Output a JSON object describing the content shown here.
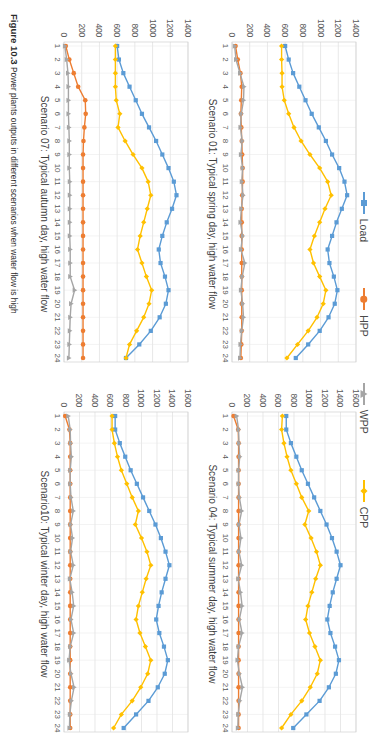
{
  "figure": {
    "caption_label": "Figure 10.3",
    "caption_text": "Power plants outputs in different scenarios when water flow is high"
  },
  "legend": {
    "items": [
      {
        "label": "Load",
        "marker": "square-marker-icon",
        "color": "#5B9BD5"
      },
      {
        "label": "HPP",
        "marker": "circle-marker-icon",
        "color": "#ED7D31"
      },
      {
        "label": "WPP",
        "marker": "triangle-marker-icon",
        "color": "#A5A5A5"
      },
      {
        "label": "CPP",
        "marker": "diamond-marker-icon",
        "color": "#FFC000"
      }
    ]
  },
  "chart_data": [
    {
      "id": "scenario-01",
      "type": "line",
      "title": "Scenario 01: Typical spring day, high water flow",
      "xlabel": "",
      "ylabel": "",
      "x": [
        1,
        2,
        3,
        4,
        5,
        6,
        7,
        8,
        9,
        10,
        11,
        12,
        13,
        14,
        15,
        16,
        17,
        18,
        19,
        20,
        21,
        22,
        23,
        24
      ],
      "xticklabels": [
        "1",
        "2",
        "3",
        "4",
        "5",
        "6",
        "7",
        "8",
        "9",
        "10",
        "11",
        "12",
        "13",
        "14",
        "15",
        "16",
        "17",
        "18",
        "19",
        "20",
        "21",
        "22",
        "23",
        "24"
      ],
      "yticklabels": [
        "0",
        "200",
        "400",
        "600",
        "800",
        "1000",
        "1200",
        "1400"
      ],
      "ylim": [
        0,
        1400
      ],
      "yticks": [
        0,
        200,
        400,
        600,
        800,
        1000,
        1200,
        1400
      ],
      "grid": true,
      "legend_position": "top",
      "series": [
        {
          "name": "Load",
          "color": "#5B9BD5",
          "marker": "square",
          "values": [
            600,
            640,
            690,
            760,
            830,
            900,
            980,
            1060,
            1130,
            1210,
            1270,
            1300,
            1240,
            1180,
            1130,
            1080,
            1100,
            1150,
            1190,
            1160,
            1090,
            990,
            860,
            720
          ]
        },
        {
          "name": "CPP",
          "color": "#FFC000",
          "marker": "diamond",
          "values": [
            560,
            560,
            565,
            565,
            590,
            640,
            700,
            780,
            880,
            990,
            1080,
            1120,
            1050,
            990,
            930,
            880,
            920,
            990,
            1060,
            1030,
            960,
            860,
            740,
            620
          ]
        },
        {
          "name": "HPP",
          "color": "#ED7D31",
          "marker": "circle",
          "values": [
            40,
            65,
            95,
            110,
            105,
            100,
            105,
            110,
            115,
            120,
            120,
            115,
            110,
            110,
            110,
            110,
            110,
            110,
            110,
            110,
            110,
            110,
            105,
            100
          ]
        },
        {
          "name": "WPP",
          "color": "#A5A5A5",
          "marker": "triangle",
          "values": [
            30,
            45,
            90,
            135,
            130,
            105,
            95,
            115,
            100,
            120,
            110,
            125,
            105,
            95,
            120,
            100,
            145,
            115,
            100,
            120,
            130,
            110,
            95,
            90
          ]
        }
      ]
    },
    {
      "id": "scenario-04",
      "type": "line",
      "title": "Scenario 04: Typical summer day, high water flow",
      "xlabel": "",
      "ylabel": "",
      "x": [
        1,
        2,
        3,
        4,
        5,
        6,
        7,
        8,
        9,
        10,
        11,
        12,
        13,
        14,
        15,
        16,
        17,
        18,
        19,
        20,
        21,
        22,
        23,
        24
      ],
      "xticklabels": [
        "1",
        "2",
        "3",
        "4",
        "5",
        "6",
        "7",
        "8",
        "9",
        "10",
        "11",
        "12",
        "13",
        "14",
        "15",
        "16",
        "17",
        "18",
        "19",
        "20",
        "21",
        "22",
        "23",
        "24"
      ],
      "yticklabels": [
        "0",
        "200",
        "400",
        "600",
        "800",
        "1000",
        "1200",
        "1400",
        "1600"
      ],
      "ylim": [
        0,
        1600
      ],
      "yticks": [
        0,
        200,
        400,
        600,
        800,
        1000,
        1200,
        1400,
        1600
      ],
      "grid": true,
      "legend_position": "top",
      "series": [
        {
          "name": "Load",
          "color": "#5B9BD5",
          "marker": "square",
          "values": [
            700,
            700,
            760,
            830,
            900,
            980,
            1060,
            1140,
            1220,
            1290,
            1350,
            1400,
            1350,
            1300,
            1260,
            1230,
            1270,
            1330,
            1380,
            1340,
            1250,
            1130,
            960,
            790
          ]
        },
        {
          "name": "CPP",
          "color": "#FFC000",
          "marker": "diamond",
          "values": [
            650,
            640,
            670,
            710,
            760,
            830,
            900,
            990,
            940,
            1020,
            1090,
            1140,
            1080,
            1030,
            980,
            950,
            1000,
            1070,
            1140,
            1100,
            1010,
            900,
            760,
            640
          ]
        },
        {
          "name": "HPP",
          "color": "#ED7D31",
          "marker": "circle",
          "values": [
            20,
            80,
            85,
            85,
            85,
            85,
            85,
            85,
            85,
            85,
            85,
            85,
            85,
            85,
            85,
            85,
            85,
            85,
            85,
            85,
            85,
            85,
            85,
            85
          ]
        },
        {
          "name": "WPP",
          "color": "#A5A5A5",
          "marker": "triangle",
          "values": [
            60,
            85,
            90,
            100,
            85,
            85,
            95,
            125,
            90,
            115,
            90,
            125,
            80,
            110,
            130,
            95,
            130,
            85,
            70,
            95,
            135,
            100,
            80,
            75
          ]
        }
      ]
    },
    {
      "id": "scenario-07",
      "type": "line",
      "title": "Scenario 07: Typical autumn day, high water flow",
      "xlabel": "",
      "ylabel": "",
      "x": [
        1,
        2,
        3,
        4,
        5,
        6,
        7,
        8,
        9,
        10,
        11,
        12,
        13,
        14,
        15,
        16,
        17,
        18,
        19,
        20,
        21,
        22,
        23,
        24
      ],
      "xticklabels": [
        "1",
        "2",
        "3",
        "4",
        "5",
        "6",
        "7",
        "8",
        "9",
        "10",
        "11",
        "12",
        "13",
        "14",
        "15",
        "16",
        "17",
        "18",
        "19",
        "20",
        "21",
        "22",
        "23",
        "24"
      ],
      "yticklabels": [
        "0",
        "200",
        "400",
        "600",
        "800",
        "1000",
        "1200",
        "1400"
      ],
      "ylim": [
        0,
        1400
      ],
      "yticks": [
        0,
        200,
        400,
        600,
        800,
        1000,
        1200,
        1400
      ],
      "grid": true,
      "legend_position": "top",
      "series": [
        {
          "name": "Load",
          "color": "#5B9BD5",
          "marker": "square",
          "values": [
            600,
            620,
            670,
            740,
            810,
            880,
            960,
            1040,
            1110,
            1180,
            1240,
            1270,
            1220,
            1160,
            1110,
            1070,
            1090,
            1140,
            1180,
            1150,
            1080,
            980,
            850,
            700
          ]
        },
        {
          "name": "CPP",
          "color": "#FFC000",
          "marker": "diamond",
          "values": [
            580,
            580,
            580,
            580,
            590,
            630,
            610,
            690,
            780,
            880,
            950,
            980,
            940,
            900,
            860,
            830,
            880,
            930,
            990,
            960,
            900,
            820,
            740,
            700
          ]
        },
        {
          "name": "HPP",
          "color": "#ED7D31",
          "marker": "circle",
          "values": [
            20,
            60,
            110,
            160,
            240,
            245,
            230,
            220,
            215,
            215,
            215,
            215,
            215,
            215,
            215,
            215,
            215,
            215,
            215,
            215,
            215,
            215,
            215,
            215
          ]
        },
        {
          "name": "WPP",
          "color": "#A5A5A5",
          "marker": "triangle",
          "values": [
            10,
            30,
            45,
            50,
            50,
            50,
            55,
            60,
            60,
            60,
            65,
            65,
            65,
            65,
            65,
            70,
            70,
            70,
            120,
            80,
            70,
            65,
            60,
            55
          ]
        }
      ]
    },
    {
      "id": "scenario-10",
      "type": "line",
      "title": "Scenario10: Typical winter day, high water flow",
      "xlabel": "",
      "ylabel": "",
      "x": [
        1,
        2,
        3,
        4,
        5,
        6,
        7,
        8,
        9,
        10,
        11,
        12,
        13,
        14,
        15,
        16,
        17,
        18,
        19,
        20,
        21,
        22,
        23,
        24
      ],
      "xticklabels": [
        "1",
        "2",
        "3",
        "4",
        "5",
        "6",
        "7",
        "8",
        "9",
        "10",
        "11",
        "12",
        "13",
        "14",
        "15",
        "16",
        "17",
        "18",
        "19",
        "20",
        "21",
        "22",
        "23",
        "24"
      ],
      "yticklabels": [
        "0",
        "200",
        "400",
        "600",
        "800",
        "1000",
        "1200",
        "1400",
        "1600"
      ],
      "ylim": [
        0,
        1600
      ],
      "yticks": [
        0,
        200,
        400,
        600,
        800,
        1000,
        1200,
        1400,
        1600
      ],
      "grid": true,
      "legend_position": "top",
      "series": [
        {
          "name": "Load",
          "color": "#5B9BD5",
          "marker": "square",
          "values": [
            660,
            660,
            720,
            790,
            860,
            940,
            1020,
            1100,
            1180,
            1250,
            1310,
            1360,
            1310,
            1260,
            1220,
            1190,
            1230,
            1290,
            1340,
            1300,
            1210,
            1090,
            930,
            770
          ]
        },
        {
          "name": "CPP",
          "color": "#FFC000",
          "marker": "diamond",
          "values": [
            620,
            620,
            650,
            690,
            740,
            810,
            880,
            960,
            920,
            1000,
            1070,
            1120,
            1060,
            1010,
            960,
            930,
            980,
            1050,
            1120,
            1080,
            990,
            880,
            740,
            640
          ]
        },
        {
          "name": "HPP",
          "color": "#ED7D31",
          "marker": "circle",
          "values": [
            15,
            70,
            80,
            80,
            80,
            80,
            80,
            80,
            80,
            80,
            80,
            80,
            80,
            80,
            80,
            80,
            80,
            80,
            80,
            80,
            80,
            80,
            80,
            80
          ]
        },
        {
          "name": "WPP",
          "color": "#A5A5A5",
          "marker": "triangle",
          "values": [
            55,
            80,
            85,
            95,
            80,
            80,
            90,
            120,
            85,
            110,
            85,
            120,
            75,
            105,
            125,
            90,
            125,
            80,
            65,
            90,
            130,
            95,
            75,
            70
          ]
        }
      ]
    }
  ]
}
